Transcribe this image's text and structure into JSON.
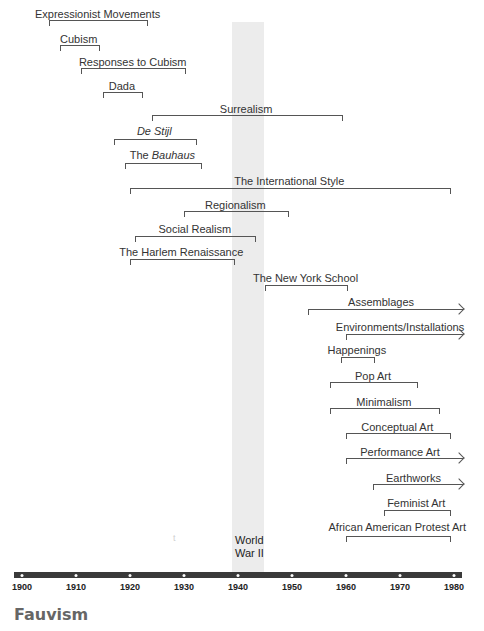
{
  "chart_data": {
    "type": "timeline",
    "title": "",
    "xlabel": "",
    "ylabel": "",
    "xlim": [
      1900,
      1980
    ],
    "x_ticks": [
      1900,
      1910,
      1920,
      1930,
      1940,
      1950,
      1960,
      1970,
      1980
    ],
    "grid": false,
    "highlight_band": {
      "label": "World War II",
      "label_lines": [
        "World",
        "War II"
      ],
      "start": 1939,
      "end": 1945
    },
    "movements": [
      {
        "name": "Expressionist Movements",
        "start": 1905,
        "end": 1923,
        "ongoing": false,
        "italic": false
      },
      {
        "name": "Cubism",
        "start": 1907,
        "end": 1914,
        "ongoing": false,
        "italic": false
      },
      {
        "name": "Responses to Cubism",
        "start": 1911,
        "end": 1930,
        "ongoing": false,
        "italic": false
      },
      {
        "name": "Dada",
        "start": 1915,
        "end": 1922,
        "ongoing": false,
        "italic": false
      },
      {
        "name": "Surrealism",
        "start": 1924,
        "end": 1959,
        "ongoing": false,
        "italic": false
      },
      {
        "name": "De Stijl",
        "start": 1917,
        "end": 1932,
        "ongoing": false,
        "italic": true
      },
      {
        "name": "The Bauhaus",
        "prefix": "The ",
        "emph": "Bauhaus",
        "start": 1919,
        "end": 1933,
        "ongoing": false,
        "italic": "partial"
      },
      {
        "name": "The International Style",
        "start": 1920,
        "end": 1979,
        "ongoing": false,
        "italic": false
      },
      {
        "name": "Regionalism",
        "start": 1930,
        "end": 1949,
        "ongoing": false,
        "italic": false
      },
      {
        "name": "Social Realism",
        "start": 1921,
        "end": 1943,
        "ongoing": false,
        "italic": false
      },
      {
        "name": "The Harlem Renaissance",
        "start": 1920,
        "end": 1939,
        "ongoing": false,
        "italic": false
      },
      {
        "name": "The New York School",
        "start": 1945,
        "end": 1960,
        "ongoing": false,
        "italic": false
      },
      {
        "name": "Assemblages",
        "start": 1953,
        "end": 1980,
        "ongoing": true,
        "italic": false
      },
      {
        "name": "Environments/Installations",
        "start": 1960,
        "end": 1980,
        "ongoing": true,
        "italic": false
      },
      {
        "name": "Happenings",
        "start": 1959,
        "end": 1965,
        "ongoing": false,
        "italic": false
      },
      {
        "name": "Pop Art",
        "start": 1957,
        "end": 1973,
        "ongoing": false,
        "italic": false
      },
      {
        "name": "Minimalism",
        "start": 1957,
        "end": 1977,
        "ongoing": false,
        "italic": false
      },
      {
        "name": "Conceptual Art",
        "start": 1960,
        "end": 1979,
        "ongoing": false,
        "italic": false
      },
      {
        "name": "Performance Art",
        "start": 1960,
        "end": 1980,
        "ongoing": true,
        "italic": false
      },
      {
        "name": "Earthworks",
        "start": 1965,
        "end": 1980,
        "ongoing": true,
        "italic": false
      },
      {
        "name": "Feminist Art",
        "start": 1967,
        "end": 1979,
        "ongoing": false,
        "italic": false
      },
      {
        "name": "African American Protest Art",
        "start": 1960,
        "end": 1979,
        "ongoing": false,
        "italic": false
      }
    ]
  },
  "axis": {
    "labels": [
      "1900",
      "1910",
      "1920",
      "1930",
      "1940",
      "1950",
      "1960",
      "1970",
      "1980"
    ]
  },
  "wwii": {
    "line1": "World",
    "line2": "War II"
  },
  "stray_mark": "t",
  "section_title": "Fauvism"
}
